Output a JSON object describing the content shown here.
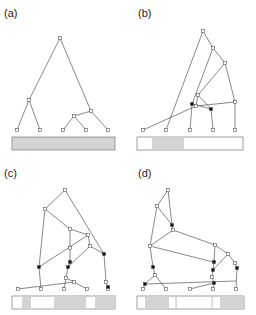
{
  "panels": [
    {
      "label": "(a)"
    },
    {
      "label": "(b)"
    },
    {
      "label": "(c)"
    },
    {
      "label": "(d)"
    }
  ],
  "colors": {
    "edge": "#555555",
    "node_open_fill": "#ffffff",
    "node_filled": "#111111",
    "bar_gray": "#d4d4d4",
    "bar_border": "#777777"
  }
}
